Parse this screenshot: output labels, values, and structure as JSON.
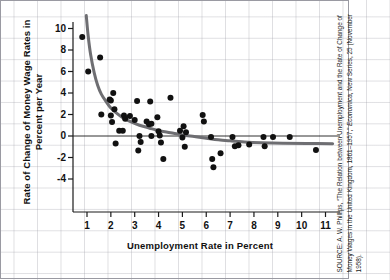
{
  "chart_data": {
    "type": "scatter",
    "title": "",
    "xlabel": "Unemployment Rate in Percent",
    "ylabel": "Rate of Change of Money Wage Rates in Percent per Year",
    "xlim": [
      0.3,
      11.6
    ],
    "ylim": [
      -5.2,
      11.3
    ],
    "xticks": [
      1,
      2,
      3,
      4,
      5,
      6,
      7,
      8,
      9,
      10,
      11
    ],
    "yticks": [
      10,
      8,
      6,
      4,
      2,
      0,
      -2,
      -4
    ],
    "grid": true,
    "legend": null,
    "zero_line": 0,
    "series": [
      {
        "name": "UK wage inflation vs unemployment, 1861-1957",
        "marker": "filled-circle",
        "color": "#111111",
        "points": [
          [
            0.8,
            9.2
          ],
          [
            1.05,
            6.0
          ],
          [
            1.55,
            7.3
          ],
          [
            1.6,
            2.0
          ],
          [
            1.95,
            3.4
          ],
          [
            2.0,
            3.3
          ],
          [
            2.0,
            1.9
          ],
          [
            2.05,
            1.3
          ],
          [
            2.1,
            4.0
          ],
          [
            2.15,
            2.5
          ],
          [
            2.2,
            -0.7
          ],
          [
            2.35,
            0.5
          ],
          [
            2.5,
            0.5
          ],
          [
            2.55,
            1.9
          ],
          [
            2.6,
            1.6
          ],
          [
            2.8,
            1.85
          ],
          [
            3.0,
            1.5
          ],
          [
            3.1,
            3.25
          ],
          [
            3.15,
            -1.35
          ],
          [
            3.2,
            0.0
          ],
          [
            3.25,
            -0.55
          ],
          [
            3.5,
            1.35
          ],
          [
            3.6,
            1.1
          ],
          [
            3.65,
            3.2
          ],
          [
            3.7,
            1.15
          ],
          [
            3.7,
            0.0
          ],
          [
            3.95,
            1.75
          ],
          [
            4.0,
            0.45
          ],
          [
            4.05,
            0.05
          ],
          [
            4.1,
            -0.6
          ],
          [
            4.2,
            -2.15
          ],
          [
            4.5,
            3.55
          ],
          [
            4.9,
            0.5
          ],
          [
            5.0,
            -0.15
          ],
          [
            5.05,
            0.9
          ],
          [
            5.1,
            -1.0
          ],
          [
            5.15,
            0.35
          ],
          [
            5.85,
            1.95
          ],
          [
            5.9,
            1.35
          ],
          [
            6.2,
            -0.1
          ],
          [
            6.25,
            -2.15
          ],
          [
            6.3,
            -2.9
          ],
          [
            6.6,
            -1.6
          ],
          [
            7.1,
            -0.1
          ],
          [
            7.2,
            -0.95
          ],
          [
            7.35,
            -0.85
          ],
          [
            7.8,
            -0.8
          ],
          [
            8.4,
            -0.1
          ],
          [
            8.45,
            -0.95
          ],
          [
            8.8,
            -0.1
          ],
          [
            9.5,
            -0.1
          ],
          [
            10.6,
            -1.3
          ]
        ]
      }
    ],
    "fitted_curve": {
      "name": "Phillips curve fit",
      "color": "#6e6e72",
      "width": 3,
      "points": [
        [
          0.97,
          11.2
        ],
        [
          1.05,
          9.3
        ],
        [
          1.15,
          7.6
        ],
        [
          1.3,
          5.9
        ],
        [
          1.45,
          4.7
        ],
        [
          1.6,
          3.9
        ],
        [
          1.8,
          3.2
        ],
        [
          2.0,
          2.6
        ],
        [
          2.2,
          2.2
        ],
        [
          2.5,
          1.7
        ],
        [
          2.8,
          1.35
        ],
        [
          3.2,
          1.0
        ],
        [
          3.6,
          0.75
        ],
        [
          4.0,
          0.5
        ],
        [
          4.5,
          0.3
        ],
        [
          5.0,
          0.1
        ],
        [
          5.5,
          -0.05
        ],
        [
          6.0,
          -0.2
        ],
        [
          6.5,
          -0.35
        ],
        [
          7.0,
          -0.45
        ],
        [
          7.6,
          -0.55
        ],
        [
          8.3,
          -0.62
        ],
        [
          9.2,
          -0.67
        ],
        [
          10.2,
          -0.7
        ],
        [
          11.3,
          -0.72
        ]
      ]
    }
  },
  "source": {
    "prefix": "SOURCE: A. W. Phillips, “The Relation between Unemployment and the Rate of Change of Money Wages in the United Kingdom, 1861–1957,” ",
    "journal": "Economica",
    "suffix": ", New Series, 25 (November 1958)."
  },
  "colors": {
    "marker": "#111111",
    "curve": "#6e6e72",
    "axis": "#1a1a1a",
    "grid": "#9696a0",
    "frame": "#9a9aa2",
    "background": "#ffffff"
  }
}
